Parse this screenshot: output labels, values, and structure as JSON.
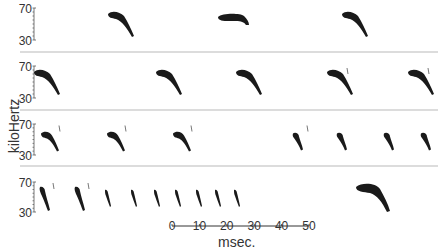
{
  "figure": {
    "y_axis_label": "kiloHertz",
    "x_axis_label": "msec.",
    "panel_y_ticks": [
      "70",
      "30"
    ],
    "scale_bar": {
      "ticks": [
        "0",
        "10",
        "20",
        "30",
        "40",
        "50"
      ],
      "x_start": 172,
      "x_end": 309,
      "y": 226
    },
    "separator_color": "#d0d0d0",
    "call_color": "#1a1a1a",
    "panels": [
      {
        "name": "panel-1",
        "top": 8,
        "bottom": 40,
        "calls": [
          {
            "x": 118,
            "type": "fm-long",
            "harmonic": false
          },
          {
            "x": 232,
            "type": "cf-flat",
            "harmonic": false
          },
          {
            "x": 352,
            "type": "fm-long",
            "harmonic": false
          }
        ]
      },
      {
        "name": "panel-2",
        "top": 66,
        "bottom": 98,
        "calls": [
          {
            "x": 44,
            "type": "fm-long",
            "harmonic": false
          },
          {
            "x": 166,
            "type": "fm-long",
            "harmonic": false
          },
          {
            "x": 246,
            "type": "fm-long",
            "harmonic": false
          },
          {
            "x": 337,
            "type": "fm-long",
            "harmonic": true
          },
          {
            "x": 418,
            "type": "fm-long",
            "harmonic": true
          }
        ]
      },
      {
        "name": "panel-3",
        "top": 124,
        "bottom": 155,
        "calls": [
          {
            "x": 49,
            "type": "fm-mid",
            "harmonic": true
          },
          {
            "x": 115,
            "type": "fm-mid",
            "harmonic": true
          },
          {
            "x": 181,
            "type": "fm-mid",
            "harmonic": true
          },
          {
            "x": 297,
            "type": "fm-short",
            "harmonic": true
          },
          {
            "x": 341,
            "type": "fm-short",
            "harmonic": false
          },
          {
            "x": 388,
            "type": "fm-short",
            "harmonic": false
          },
          {
            "x": 425,
            "type": "fm-short",
            "harmonic": false
          }
        ]
      },
      {
        "name": "panel-4",
        "top": 182,
        "bottom": 212,
        "calls": [
          {
            "x": 43,
            "type": "fm-steep",
            "harmonic": true
          },
          {
            "x": 78,
            "type": "fm-steep",
            "harmonic": true
          },
          {
            "x": 107,
            "type": "fm-steep-thin",
            "harmonic": false
          },
          {
            "x": 133,
            "type": "fm-steep-thin",
            "harmonic": false
          },
          {
            "x": 156,
            "type": "fm-steep-thin",
            "harmonic": false
          },
          {
            "x": 177,
            "type": "fm-steep-thin",
            "harmonic": false
          },
          {
            "x": 198,
            "type": "fm-steep-thin",
            "harmonic": false
          },
          {
            "x": 217,
            "type": "fm-steep-thin",
            "harmonic": false
          },
          {
            "x": 236,
            "type": "fm-steep-thin",
            "harmonic": false
          },
          {
            "x": 370,
            "type": "fm-long-large",
            "harmonic": false
          }
        ]
      }
    ],
    "separators_y": [
      52,
      110,
      166
    ]
  }
}
